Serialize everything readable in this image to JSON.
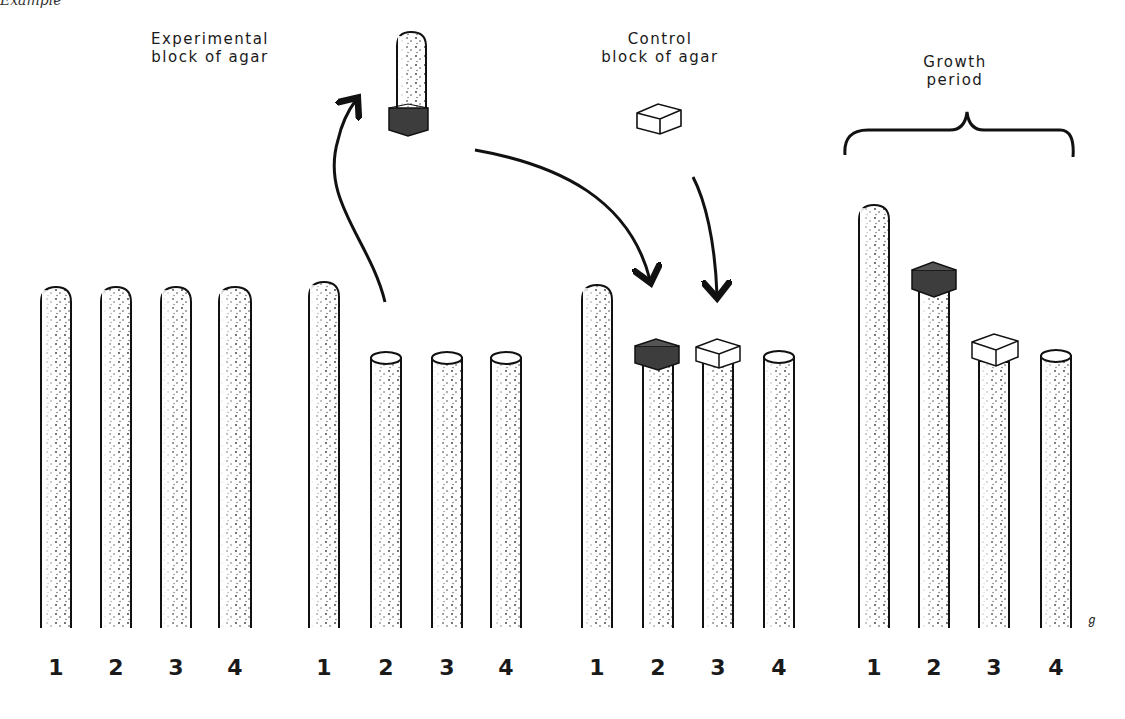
{
  "figure": {
    "cut_caption": "Example",
    "labels": {
      "experimental": [
        "Experimental",
        "block of agar"
      ],
      "control": [
        "Control",
        "block of agar"
      ],
      "growth": [
        "Growth",
        "period"
      ]
    },
    "signature": "ℊ"
  },
  "groups": [
    {
      "name": "group-1",
      "numbers": [
        "1",
        "2",
        "3",
        "4"
      ]
    },
    {
      "name": "group-2",
      "numbers": [
        "1",
        "2",
        "3",
        "4"
      ]
    },
    {
      "name": "group-3",
      "numbers": [
        "1",
        "2",
        "3",
        "4"
      ]
    },
    {
      "name": "group-4",
      "numbers": [
        "1",
        "2",
        "3",
        "4"
      ]
    }
  ],
  "colors": {
    "ink": "#1a1a1a",
    "stipple": "#3a3a3a",
    "dark_block": "#3d3d3d",
    "light_block": "#ffffff",
    "background": "#ffffff"
  }
}
